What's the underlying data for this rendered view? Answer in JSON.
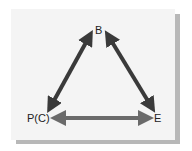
{
  "diagram": {
    "nodes": [
      {
        "id": "B",
        "label": "B"
      },
      {
        "id": "PC",
        "label": "P(C)"
      },
      {
        "id": "E",
        "label": "E"
      }
    ],
    "edges": [
      {
        "from": "B",
        "to": "PC",
        "type": "bidirectional"
      },
      {
        "from": "B",
        "to": "E",
        "type": "bidirectional"
      },
      {
        "from": "PC",
        "to": "E",
        "type": "bidirectional"
      }
    ],
    "colors": {
      "arrow_dark": "#3a3a3a",
      "arrow_mid": "#6a6a6a",
      "card": "#f4f4f4",
      "shadow": "#b8b8b8"
    }
  }
}
